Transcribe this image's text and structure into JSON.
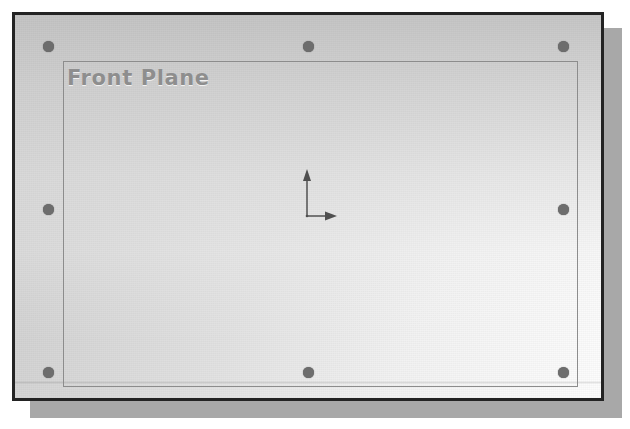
{
  "window": {
    "name": "cad-graphics-viewport",
    "frame_border_color": "#232323",
    "shadow_color": "#a8a8a8",
    "background_top_color": "#c9c9c9",
    "background_bottom_color": "#ffffff"
  },
  "plane": {
    "label": "Front Plane",
    "label_color": "#8e8e8e",
    "outline_color": "#8c8c8c",
    "handle_color": "#6d6d6d",
    "selected": true,
    "handles": [
      {
        "name": "handle-top-left",
        "x": 48,
        "y": 46
      },
      {
        "name": "handle-top-center",
        "x": 308,
        "y": 46
      },
      {
        "name": "handle-top-right",
        "x": 563,
        "y": 46
      },
      {
        "name": "handle-middle-left",
        "x": 48,
        "y": 209
      },
      {
        "name": "handle-middle-right",
        "x": 563,
        "y": 209
      },
      {
        "name": "handle-bottom-left",
        "x": 48,
        "y": 372
      },
      {
        "name": "handle-bottom-center",
        "x": 308,
        "y": 372
      },
      {
        "name": "handle-bottom-right",
        "x": 563,
        "y": 372
      }
    ]
  },
  "origin_triad": {
    "name": "origin-coordinate-triad",
    "color": "#5a5a5a",
    "axes": [
      {
        "name": "y-axis-arrow",
        "direction": "up"
      },
      {
        "name": "x-axis-arrow",
        "direction": "right"
      }
    ]
  }
}
